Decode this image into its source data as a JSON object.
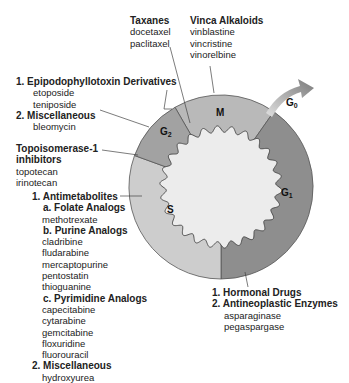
{
  "colors": {
    "M": "#b9b9b9",
    "G1": "#8e8e8e",
    "G2": "#a2a2a2",
    "S": "#cdcdcd",
    "center": "#ececec",
    "arrow": "#8a8a8a"
  },
  "phases": {
    "M": "M",
    "G1": "G",
    "G1_sub": "1",
    "G2": "G",
    "G2_sub": "2",
    "S": "S",
    "G0": "G",
    "G0_sub": "0"
  },
  "taxanes": {
    "heading": "Taxanes",
    "drugs": [
      "docetaxel",
      "paclitaxel"
    ]
  },
  "vinca": {
    "heading": "Vinca Alkaloids",
    "drugs": [
      "vinblastine",
      "vincristine",
      "vinorelbine"
    ]
  },
  "g2_group": {
    "epipodophyllotoxin": {
      "heading": "1. Epipodophyllotoxin Derivatives",
      "drugs": [
        "etoposide",
        "teniposide"
      ]
    },
    "misc": {
      "heading": "2. Miscellaneous",
      "drugs": [
        "bleomycin"
      ]
    }
  },
  "topo": {
    "heading_line1": "Topoisomerase-1",
    "heading_line2": "inhibitors",
    "drugs": [
      "topotecan",
      "irinotecan"
    ]
  },
  "s_group": {
    "antimetabolites": "1. Antimetabolites",
    "folate": {
      "heading": "a. Folate Analogs",
      "drugs": [
        "methotrexate"
      ]
    },
    "purine": {
      "heading": "b. Purine Analogs",
      "drugs": [
        "cladribine",
        "fludarabine",
        "mercaptopurine",
        "pentostatin",
        "thioguanine"
      ]
    },
    "pyrimidine": {
      "heading": "c. Pyrimidine Analogs",
      "drugs": [
        "capecitabine",
        "cytarabine",
        "gemcitabine",
        "floxuridine",
        "fluorouracil"
      ]
    },
    "misc": {
      "heading": "2. Miscellaneous",
      "drugs": [
        "hydroxyurea"
      ]
    }
  },
  "g1_group": {
    "hormonal": "1. Hormonal Drugs",
    "enzymes": {
      "heading": "2. Antineoplastic Enzymes",
      "drugs": [
        "asparaginase",
        "pegaspargase"
      ]
    }
  }
}
